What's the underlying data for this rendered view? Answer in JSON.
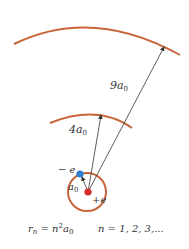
{
  "diagram": {
    "colors": {
      "orbit": "#c8663a",
      "electron": "#2f7fd0",
      "nucleus": "#d62b2b",
      "arrow": "#333333"
    },
    "labels": {
      "orbit3_radius": "9a",
      "orbit3_sub": "0",
      "orbit2_radius": "4a",
      "orbit2_sub": "0",
      "orbit1_radius": "a",
      "orbit1_sub": "0",
      "electron_charge": "− e",
      "nucleus_charge": "+e"
    },
    "formula": {
      "lhs": "r",
      "lhs_sub": "n",
      "eq": " = ",
      "rhs_n": "n",
      "rhs_sup": "2",
      "rhs_a": "a",
      "rhs_sub": "0",
      "condition": "n  =  1, 2, 3,..."
    }
  }
}
